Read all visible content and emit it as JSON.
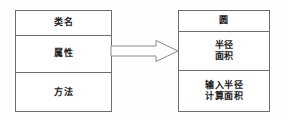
{
  "diagram": {
    "type": "uml-class-diagram",
    "title": "",
    "colors": {
      "border": "#6e6e6e",
      "text": "#1a1a1a",
      "background": "#ffffff",
      "arrow_stroke": "#8a8a8a",
      "arrow_fill": "#ffffff"
    },
    "boxes": [
      {
        "id": "template",
        "role": "generic-class-template",
        "compartments": [
          {
            "name": "class-name",
            "lines": [
              "类名"
            ]
          },
          {
            "name": "attributes",
            "lines": [
              "属性"
            ]
          },
          {
            "name": "methods",
            "lines": [
              "方法"
            ]
          }
        ]
      },
      {
        "id": "circle",
        "role": "concrete-class-example",
        "compartments": [
          {
            "name": "class-name",
            "lines": [
              "圆"
            ]
          },
          {
            "name": "attributes",
            "lines": [
              "半径",
              "面积"
            ]
          },
          {
            "name": "methods",
            "lines": [
              "输入半径",
              "计算面积"
            ]
          }
        ]
      }
    ],
    "connector": {
      "name": "hollow-block-arrow",
      "shape": "open-block-arrow",
      "direction": "right",
      "from": "template",
      "to": "circle",
      "label": ""
    }
  }
}
